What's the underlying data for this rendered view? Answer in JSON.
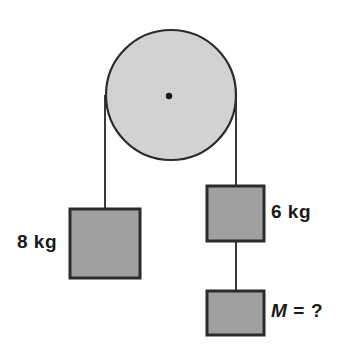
{
  "diagram": {
    "colors": {
      "background": "#ffffff",
      "pulley_fill": "#d2d2d2",
      "block_fill": "#a0a0a0",
      "outline": "#2b2b2b",
      "rope": "#3a3a3a",
      "text": "#1a1a1a"
    },
    "pulley": {
      "name": "pulley-wheel",
      "center_x": 171,
      "center_y": 95,
      "radius": 65,
      "stroke_width": 2.2,
      "axle_radius": 3.2
    },
    "ropes": [
      {
        "name": "rope-left",
        "x1": 105,
        "y1": 95,
        "x2": 105,
        "y2": 210
      },
      {
        "name": "rope-right",
        "x1": 236,
        "y1": 95,
        "x2": 236,
        "y2": 187
      },
      {
        "name": "rope-between-blocks",
        "x1": 236,
        "y1": 241,
        "x2": 236,
        "y2": 292
      }
    ],
    "blocks": [
      {
        "name": "block-left",
        "x": 70,
        "y": 209,
        "width": 70,
        "height": 69
      },
      {
        "name": "block-right-upper",
        "x": 207,
        "y": 186,
        "width": 57,
        "height": 55
      },
      {
        "name": "block-right-lower",
        "x": 207,
        "y": 291,
        "width": 57,
        "height": 44
      }
    ],
    "labels": {
      "left_mass": "8 kg",
      "right_mass": "6 kg",
      "unknown_symbol": "M",
      "unknown_equals": "=",
      "unknown_value": "?"
    }
  }
}
